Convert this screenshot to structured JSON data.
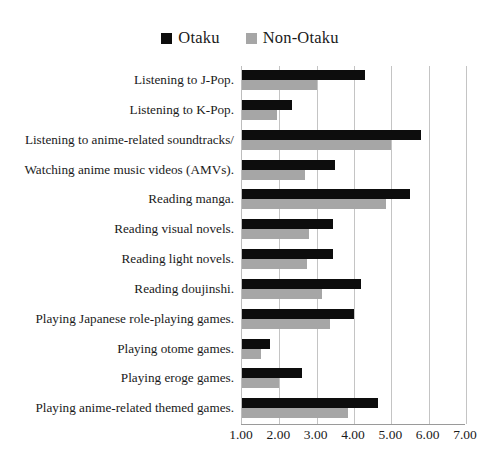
{
  "chart_data": {
    "type": "bar",
    "orientation": "horizontal",
    "title": "",
    "xlabel": "",
    "ylabel": "",
    "xlim": [
      1.0,
      7.0
    ],
    "grid": true,
    "legend_position": "top-center",
    "xtick_labels": [
      "1.00",
      "2.00",
      "3.00",
      "4.00",
      "5.00",
      "6.00",
      "7.00"
    ],
    "xticks": [
      1.0,
      2.0,
      3.0,
      4.0,
      5.0,
      6.0,
      7.0
    ],
    "categories": [
      "Listening to J-Pop.",
      "Listening to K-Pop.",
      "Listening to anime-related soundtracks/",
      "Watching anime music videos (AMVs).",
      "Reading manga.",
      "Reading visual novels.",
      "Reading light novels.",
      "Reading doujinshi.",
      "Playing Japanese role-playing games.",
      "Playing otome games.",
      "Playing eroge games.",
      "Playing anime-related themed games."
    ],
    "series": [
      {
        "name": "Otaku",
        "color": "#0d0d0d",
        "values": [
          4.3,
          2.35,
          5.8,
          3.5,
          5.5,
          3.45,
          3.45,
          4.2,
          4.0,
          1.75,
          2.6,
          4.65
        ]
      },
      {
        "name": "Non-Otaku",
        "color": "#a6a6a6",
        "values": [
          3.0,
          1.95,
          5.0,
          2.7,
          4.85,
          2.8,
          2.75,
          3.15,
          3.35,
          1.5,
          2.0,
          3.85
        ]
      }
    ]
  },
  "legend": {
    "entries": [
      {
        "label": "Otaku",
        "color": "#0d0d0d",
        "swatch": "square-marker"
      },
      {
        "label": "Non-Otaku",
        "color": "#a6a6a6",
        "swatch": "square-marker"
      }
    ]
  }
}
